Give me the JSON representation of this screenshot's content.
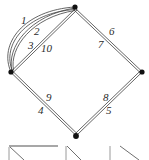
{
  "figure": {
    "name": "multigraph-edge-labeled-quadrilateral",
    "background_color": "#ffffff",
    "stroke_color": "#4a4a4a",
    "vertex_color": "#111111",
    "label_color": "#2b2b2b",
    "width": 149,
    "height": 160
  },
  "graph": {
    "vertices": [
      {
        "id": "top",
        "label": "",
        "x": 75,
        "y": 7
      },
      {
        "id": "left",
        "label": "",
        "x": 11,
        "y": 72
      },
      {
        "id": "right",
        "label": "",
        "x": 142,
        "y": 72
      },
      {
        "id": "bottom",
        "label": "",
        "x": 76,
        "y": 136
      }
    ],
    "edges": [
      {
        "id": "e1",
        "label": "1",
        "from": "left",
        "to": "top",
        "shape": "arc-outer",
        "label_x": 21,
        "label_y": 15
      },
      {
        "id": "e2",
        "label": "2",
        "from": "left",
        "to": "top",
        "shape": "arc-inner",
        "label_x": 34,
        "label_y": 26
      },
      {
        "id": "e3",
        "label": "3",
        "from": "left",
        "to": "top",
        "shape": "straight",
        "label_x": 28,
        "label_y": 40
      },
      {
        "id": "e10",
        "label": "10",
        "from": "left",
        "to": "top",
        "shape": "straight",
        "label_x": 41,
        "label_y": 43
      },
      {
        "id": "e6",
        "label": "6",
        "from": "top",
        "to": "right",
        "shape": "straight",
        "label_x": 109,
        "label_y": 26
      },
      {
        "id": "e7",
        "label": "7",
        "from": "top",
        "to": "right",
        "shape": "straight",
        "label_x": 98,
        "label_y": 39
      },
      {
        "id": "e8",
        "label": "8",
        "from": "right",
        "to": "bottom",
        "shape": "straight",
        "label_x": 103,
        "label_y": 92
      },
      {
        "id": "e5",
        "label": "5",
        "from": "right",
        "to": "bottom",
        "shape": "straight",
        "label_x": 106,
        "label_y": 105
      },
      {
        "id": "e9",
        "label": "9",
        "from": "left",
        "to": "bottom",
        "shape": "straight",
        "label_x": 46,
        "label_y": 92
      },
      {
        "id": "e4",
        "label": "4",
        "from": "left",
        "to": "bottom",
        "shape": "straight",
        "label_x": 38,
        "label_y": 105
      }
    ],
    "edge_labels_in_order": [
      "1",
      "2",
      "3",
      "10",
      "6",
      "7",
      "8",
      "5",
      "9",
      "4"
    ]
  },
  "bottom_strip": {
    "description": "partial row of cropped line-drawing thumbnails",
    "items": [
      {
        "id": "thumb-1",
        "name": "horizontal-line-with-diagonal"
      },
      {
        "id": "thumb-2",
        "name": "diagonal-corner"
      },
      {
        "id": "thumb-3",
        "name": "vertical-line-with-diagonal"
      }
    ]
  }
}
